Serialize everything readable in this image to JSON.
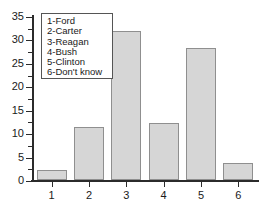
{
  "chart_data": {
    "type": "bar",
    "title": "",
    "xlabel": "",
    "ylabel": "",
    "categories": [
      "1",
      "2",
      "3",
      "4",
      "5",
      "6"
    ],
    "values": [
      2.2,
      11.3,
      31.8,
      12.2,
      28.2,
      3.7
    ],
    "ylim": [
      0,
      35
    ],
    "ytick_labels": [
      "0",
      "5",
      "10",
      "15",
      "20",
      "25",
      "30",
      "35"
    ],
    "ytick_values": [
      0,
      5,
      10,
      15,
      20,
      25,
      30,
      35
    ],
    "yminor_values": [
      2.5,
      7.5,
      12.5,
      17.5,
      22.5,
      27.5,
      32.5
    ],
    "grid": false,
    "legend_position": "upper-left",
    "legend_entries": [
      "1-Ford",
      "2-Carter",
      "3-Reagan",
      "4-Bush",
      "5-Clinton",
      "6-Don't know"
    ],
    "bar_fill_color": "#d6d6d6",
    "bar_edge_color": "#8f8f8f",
    "axis_color": "#2b2b2b"
  }
}
